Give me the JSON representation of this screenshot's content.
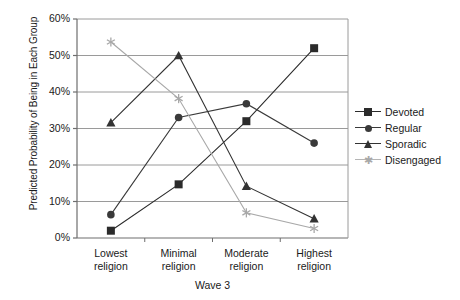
{
  "chart_data": {
    "type": "line",
    "title": "",
    "xlabel": "Wave 3",
    "ylabel": "Predicted Probability of Being in Each Group",
    "categories": [
      "Lowest religion",
      "Minimal religion",
      "Moderate religion",
      "Highest religion"
    ],
    "category_lines": [
      [
        "Lowest",
        "religion"
      ],
      [
        "Minimal",
        "religion"
      ],
      [
        "Moderate",
        "religion"
      ],
      [
        "Highest",
        "religion"
      ]
    ],
    "ylim": [
      0,
      60
    ],
    "yticks": [
      0,
      10,
      20,
      30,
      40,
      50,
      60
    ],
    "ytick_labels": [
      "0%",
      "10%",
      "20%",
      "30%",
      "40%",
      "50%",
      "60%"
    ],
    "grid": true,
    "legend_position": "right",
    "series": [
      {
        "name": "Devoted",
        "marker": "square",
        "color": "#2b2b2b",
        "values": [
          2,
          14.7,
          32,
          52
        ]
      },
      {
        "name": "Regular",
        "marker": "circle",
        "color": "#3a3a3a",
        "values": [
          6.4,
          33,
          36.8,
          26
        ]
      },
      {
        "name": "Sporadic",
        "marker": "triangle",
        "color": "#333333",
        "values": [
          31.6,
          50,
          14.2,
          5.3
        ]
      },
      {
        "name": "Disengaged",
        "marker": "asterisk",
        "color": "#a8a8a8",
        "values": [
          53.7,
          38.2,
          6.9,
          2.6
        ]
      }
    ]
  },
  "legend": {
    "items": [
      {
        "label": "Devoted"
      },
      {
        "label": "Regular"
      },
      {
        "label": "Sporadic"
      },
      {
        "label": "Disengaged"
      }
    ]
  },
  "axes": {
    "y_axis_label": "Predicted Probability of Being in Each Group",
    "x_axis_label": "Wave 3"
  },
  "colors": {
    "axis": "#6e6e6e",
    "grid": "#9a9a9a",
    "dark_series": "#2b2b2b",
    "light_series": "#a8a8a8",
    "text": "#1a1a1a"
  }
}
